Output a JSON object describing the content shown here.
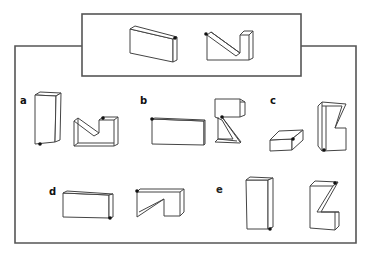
{
  "figure": {
    "reference": {
      "items": [
        "rectangular block with dot on top-right-back corner",
        "notched Z-shaped block with dot on top-left corner"
      ]
    },
    "options": [
      {
        "label": "a",
        "items": [
          "tall upright block with dot at bottom-left corner",
          "notched block with dot at top of notch"
        ]
      },
      {
        "label": "b",
        "items": [
          "flat wide block with dot at top-left corner",
          "upright Z-shaped block with dot at inner corner"
        ]
      },
      {
        "label": "c",
        "items": [
          "low flat slab with dot at front-right top corner",
          "upright notched block with dot at bottom corner"
        ]
      },
      {
        "label": "d",
        "items": [
          "wide block with dot at bottom-right corner",
          "notched block with dot at top-left corner"
        ]
      },
      {
        "label": "e",
        "items": [
          "tall upright block with dot at bottom-right corner",
          "Z-shaped block with dot at top-right corner"
        ]
      }
    ]
  },
  "colors": {
    "line": "#444444",
    "frame": "#555555",
    "dot": "#111111",
    "background": "#ffffff"
  }
}
